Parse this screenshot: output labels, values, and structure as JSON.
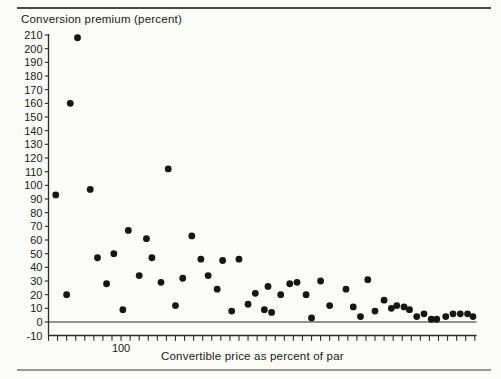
{
  "figure": {
    "title": "Conversion premium (percent)",
    "xlabel": "Convertible price as percent of par"
  },
  "colors": {
    "background": "#fbfbf8",
    "dot": "#161616",
    "axis": "#2b2b2b",
    "text": "#1a1a1a",
    "top_rule": "#4a4a4a",
    "bottom_rule": "#9a9a97"
  },
  "chart_data": {
    "type": "scatter",
    "title": "Conversion premium (percent)",
    "xlabel": "Convertible price as percent of par",
    "ylabel": "Conversion premium (percent)",
    "xlim": [
      60,
      296
    ],
    "ylim": [
      -10,
      210
    ],
    "grid": false,
    "legend": "none",
    "marker": "filled-circle",
    "y_ticks": [
      210,
      200,
      190,
      180,
      170,
      160,
      150,
      140,
      130,
      120,
      110,
      100,
      90,
      80,
      70,
      60,
      50,
      40,
      30,
      20,
      10,
      0,
      -10
    ],
    "x_tick_step": 5,
    "x_labeled_ticks": [
      {
        "value": 100,
        "label": "100"
      }
    ],
    "points": [
      [
        76,
        208
      ],
      [
        72,
        160
      ],
      [
        126,
        112
      ],
      [
        83,
        97
      ],
      [
        64,
        93
      ],
      [
        104,
        67
      ],
      [
        114,
        61
      ],
      [
        96,
        50
      ],
      [
        87,
        47
      ],
      [
        117,
        47
      ],
      [
        110,
        34
      ],
      [
        122,
        29
      ],
      [
        92,
        28
      ],
      [
        70,
        20
      ],
      [
        101,
        9
      ],
      [
        130,
        12
      ],
      [
        134,
        32
      ],
      [
        139,
        63
      ],
      [
        144,
        46
      ],
      [
        156,
        45
      ],
      [
        165,
        46
      ],
      [
        148,
        34
      ],
      [
        153,
        24
      ],
      [
        170,
        13
      ],
      [
        161,
        8
      ],
      [
        179,
        9
      ],
      [
        183,
        7
      ],
      [
        174,
        21
      ],
      [
        181,
        26
      ],
      [
        193,
        28
      ],
      [
        197,
        29
      ],
      [
        188,
        20
      ],
      [
        202,
        20
      ],
      [
        205,
        3
      ],
      [
        210,
        30
      ],
      [
        215,
        12
      ],
      [
        224,
        24
      ],
      [
        228,
        11
      ],
      [
        232,
        4
      ],
      [
        236,
        31
      ],
      [
        240,
        8
      ],
      [
        245,
        16
      ],
      [
        249,
        10
      ],
      [
        252,
        12
      ],
      [
        256,
        11
      ],
      [
        259,
        9
      ],
      [
        263,
        4
      ],
      [
        267,
        6
      ],
      [
        271,
        2
      ],
      [
        274,
        2
      ],
      [
        279,
        4
      ],
      [
        283,
        6
      ],
      [
        287,
        6
      ],
      [
        291,
        6
      ],
      [
        294,
        4
      ]
    ]
  }
}
